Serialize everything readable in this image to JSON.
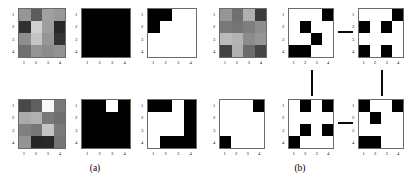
{
  "figure": {
    "captions": [
      {
        "label": "(a)",
        "x": 95,
        "y": 163
      },
      {
        "label": "(b)",
        "x": 300,
        "y": 163
      }
    ],
    "axis": {
      "xticks": [
        "1",
        "2",
        "3",
        "4"
      ],
      "yticks": [
        "1",
        "2",
        "3",
        "4"
      ]
    }
  },
  "chart_data": {
    "type": "heatmap",
    "title": "",
    "xlabel": "",
    "ylabel": "",
    "grid": false,
    "legend": "none",
    "colormap": "gray",
    "value_range": [
      0,
      255
    ],
    "note": "Each panel is a 4x4 matrix rendered as a grayscale or binary image with axis ticks 1-4 on both axes.",
    "panels": [
      {
        "id": "a-top-grayscale",
        "section": "(a)",
        "row": "top",
        "position": 1,
        "kind": "grayscale",
        "x": 18,
        "y": 8,
        "w": 48,
        "h": 50,
        "values": [
          [
            150,
            92,
            160,
            152
          ],
          [
            48,
            208,
            158,
            40
          ],
          [
            142,
            196,
            150,
            52
          ],
          [
            112,
            148,
            140,
            146
          ]
        ]
      },
      {
        "id": "a-top-binary-1",
        "section": "(a)",
        "row": "top",
        "position": 2,
        "kind": "binary",
        "x": 81,
        "y": 8,
        "w": 50,
        "h": 50,
        "values": [
          [
            0,
            0,
            0,
            0
          ],
          [
            0,
            0,
            0,
            0
          ],
          [
            0,
            0,
            0,
            0
          ],
          [
            0,
            0,
            0,
            0
          ]
        ]
      },
      {
        "id": "a-top-binary-2",
        "section": "(a)",
        "row": "top",
        "position": 3,
        "kind": "binary",
        "x": 147,
        "y": 8,
        "w": 50,
        "h": 50,
        "values": [
          [
            0,
            0,
            1,
            1
          ],
          [
            0,
            1,
            1,
            1
          ],
          [
            1,
            1,
            1,
            1
          ],
          [
            1,
            1,
            1,
            1
          ]
        ]
      },
      {
        "id": "a-bottom-grayscale",
        "section": "(a)",
        "row": "bottom",
        "position": 1,
        "kind": "grayscale",
        "x": 18,
        "y": 99,
        "w": 48,
        "h": 50,
        "values": [
          [
            72,
            96,
            248,
            120
          ],
          [
            170,
            176,
            120,
            112
          ],
          [
            128,
            118,
            196,
            122
          ],
          [
            148,
            38,
            40,
            116
          ]
        ]
      },
      {
        "id": "a-bottom-binary-1",
        "section": "(a)",
        "row": "bottom",
        "position": 2,
        "kind": "binary",
        "x": 81,
        "y": 99,
        "w": 50,
        "h": 50,
        "values": [
          [
            0,
            0,
            1,
            0
          ],
          [
            0,
            0,
            0,
            0
          ],
          [
            0,
            0,
            0,
            0
          ],
          [
            0,
            0,
            0,
            0
          ]
        ]
      },
      {
        "id": "a-bottom-binary-2",
        "section": "(a)",
        "row": "bottom",
        "position": 3,
        "kind": "binary",
        "x": 147,
        "y": 99,
        "w": 50,
        "h": 50,
        "values": [
          [
            0,
            0,
            1,
            0
          ],
          [
            1,
            1,
            1,
            0
          ],
          [
            1,
            1,
            1,
            0
          ],
          [
            1,
            0,
            0,
            0
          ]
        ]
      },
      {
        "id": "b-top-grayscale",
        "section": "(b)",
        "row": "top",
        "position": 1,
        "kind": "grayscale",
        "x": 219,
        "y": 8,
        "w": 48,
        "h": 50,
        "values": [
          [
            150,
            112,
            176,
            60
          ],
          [
            120,
            116,
            126,
            142
          ],
          [
            186,
            180,
            140,
            150
          ],
          [
            66,
            176,
            108,
            70
          ]
        ]
      },
      {
        "id": "b-top-binary-1",
        "section": "(b)",
        "row": "top",
        "position": 2,
        "kind": "binary",
        "x": 288,
        "y": 8,
        "w": 46,
        "h": 50,
        "values": [
          [
            1,
            1,
            1,
            0
          ],
          [
            1,
            0,
            1,
            1
          ],
          [
            1,
            1,
            0,
            1
          ],
          [
            0,
            0,
            1,
            1
          ]
        ]
      },
      {
        "id": "b-top-binary-2",
        "section": "(b)",
        "row": "top",
        "position": 3,
        "kind": "binary",
        "x": 358,
        "y": 8,
        "w": 46,
        "h": 50,
        "values": [
          [
            1,
            1,
            1,
            0
          ],
          [
            0,
            1,
            0,
            1
          ],
          [
            1,
            1,
            1,
            1
          ],
          [
            0,
            1,
            0,
            1
          ]
        ]
      },
      {
        "id": "b-bottom-binary-1",
        "section": "(b)",
        "row": "bottom",
        "position": 1,
        "kind": "binary",
        "x": 219,
        "y": 99,
        "w": 46,
        "h": 50,
        "values": [
          [
            1,
            1,
            1,
            0
          ],
          [
            1,
            1,
            1,
            1
          ],
          [
            1,
            1,
            1,
            1
          ],
          [
            0,
            1,
            1,
            1
          ]
        ]
      },
      {
        "id": "b-bottom-binary-2",
        "section": "(b)",
        "row": "bottom",
        "position": 2,
        "kind": "binary",
        "x": 288,
        "y": 99,
        "w": 46,
        "h": 50,
        "values": [
          [
            1,
            0,
            1,
            0
          ],
          [
            1,
            1,
            1,
            1
          ],
          [
            1,
            0,
            1,
            0
          ],
          [
            0,
            1,
            1,
            1
          ]
        ]
      },
      {
        "id": "b-bottom-binary-3",
        "section": "(b)",
        "row": "bottom",
        "position": 3,
        "kind": "binary",
        "x": 358,
        "y": 99,
        "w": 46,
        "h": 50,
        "values": [
          [
            0,
            1,
            1,
            0
          ],
          [
            1,
            0,
            1,
            1
          ],
          [
            1,
            1,
            1,
            1
          ],
          [
            0,
            0,
            1,
            1
          ]
        ]
      }
    ],
    "connectors": [
      {
        "id": "v-left",
        "orientation": "vertical",
        "x": 311,
        "y": 70,
        "length": 26
      },
      {
        "id": "v-right",
        "orientation": "vertical",
        "x": 381,
        "y": 70,
        "length": 26
      },
      {
        "id": "h-top",
        "orientation": "horizontal",
        "x": 338,
        "y": 31,
        "length": 15
      },
      {
        "id": "h-bottom",
        "orientation": "horizontal",
        "x": 338,
        "y": 122,
        "length": 15
      }
    ]
  }
}
